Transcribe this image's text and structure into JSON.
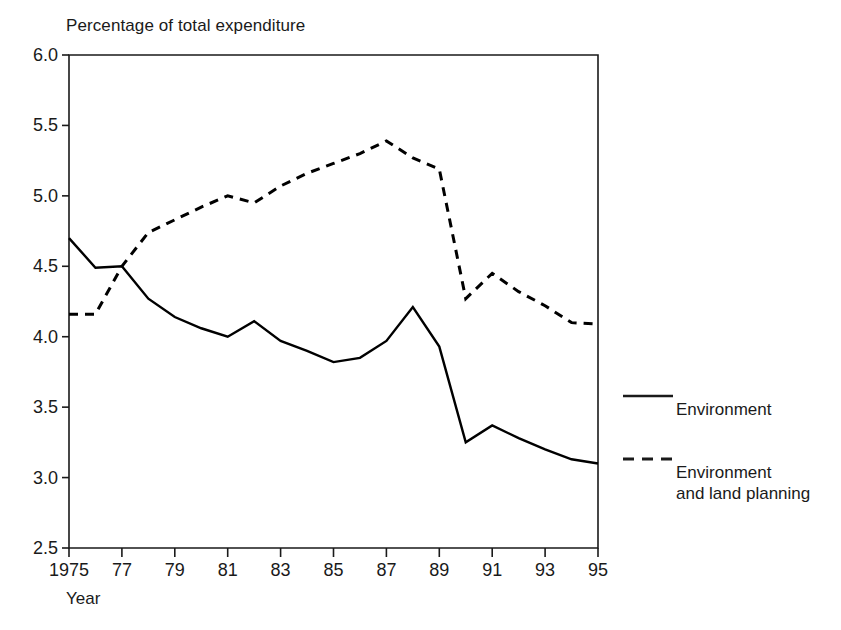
{
  "chart_data": {
    "type": "line",
    "title": "Percentage of total expenditure",
    "xlabel": "Year",
    "ylabel": "",
    "xlim": [
      1975,
      1995
    ],
    "ylim": [
      2.5,
      6.0
    ],
    "grid": false,
    "legend_position": "right",
    "x": [
      1975,
      1976,
      1977,
      1978,
      1979,
      1980,
      1981,
      1982,
      1983,
      1984,
      1985,
      1986,
      1987,
      1988,
      1989,
      1990,
      1991,
      1992,
      1993,
      1994,
      1995
    ],
    "xtick_values": [
      1975,
      1977,
      1979,
      1981,
      1983,
      1985,
      1987,
      1989,
      1991,
      1993,
      1995
    ],
    "xtick_labels": [
      "1975",
      "77",
      "79",
      "81",
      "83",
      "85",
      "87",
      "89",
      "91",
      "93",
      "95"
    ],
    "ytick_values": [
      2.5,
      3.0,
      3.5,
      4.0,
      4.5,
      5.0,
      5.5,
      6.0
    ],
    "ytick_labels": [
      "2.5",
      "3.0",
      "3.5",
      "4.0",
      "4.5",
      "5.0",
      "5.5",
      "6.0"
    ],
    "series": [
      {
        "name": "Environment",
        "style": "solid",
        "color": "#000000",
        "values": [
          4.7,
          4.49,
          4.5,
          4.27,
          4.14,
          4.06,
          4.0,
          4.11,
          3.97,
          3.9,
          3.82,
          3.85,
          3.97,
          4.21,
          3.93,
          3.25,
          3.37,
          3.28,
          3.2,
          3.13,
          3.1
        ]
      },
      {
        "name": "Environment and land planning",
        "style": "dashed",
        "color": "#000000",
        "values": [
          4.16,
          4.16,
          4.5,
          4.74,
          4.83,
          4.92,
          5.0,
          4.95,
          5.07,
          5.16,
          5.23,
          5.3,
          5.39,
          5.27,
          5.19,
          4.27,
          4.45,
          4.32,
          4.22,
          4.1,
          4.09
        ]
      }
    ]
  },
  "legend": {
    "entries": [
      {
        "label_line1": "Environment",
        "label_line2": "",
        "style": "solid"
      },
      {
        "label_line1": "Environment",
        "label_line2": "and land planning",
        "style": "dashed"
      }
    ]
  }
}
